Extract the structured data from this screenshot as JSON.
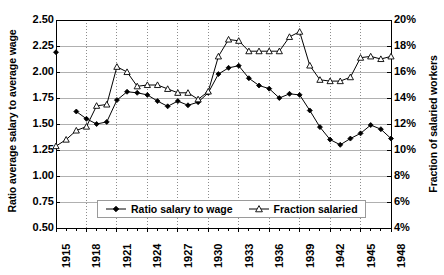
{
  "chart_data": {
    "type": "line",
    "title": "",
    "subtitle": "",
    "xlabel": "",
    "ylabel": "Ratio average salary to average wage",
    "ylabel_right": "Fraction of salaried workers",
    "grid": true,
    "legend_position": "bottom-center",
    "x": [
      1915,
      1916,
      1917,
      1918,
      1919,
      1920,
      1921,
      1922,
      1923,
      1924,
      1925,
      1926,
      1927,
      1928,
      1929,
      1930,
      1931,
      1932,
      1933,
      1934,
      1935,
      1936,
      1937,
      1938,
      1939,
      1940,
      1941,
      1942,
      1943,
      1944,
      1945,
      1946,
      1947,
      1948
    ],
    "xlim": [
      1915,
      1948
    ],
    "xtick_labels": [
      "1915",
      "1918",
      "1921",
      "1924",
      "1927",
      "1930",
      "1933",
      "1936",
      "1939",
      "1942",
      "1945",
      "1948"
    ],
    "xtick_values": [
      1915,
      1918,
      1921,
      1924,
      1927,
      1930,
      1933,
      1936,
      1939,
      1942,
      1945,
      1948
    ],
    "ylim": [
      0.5,
      2.5
    ],
    "ytick_labels": [
      "2.50",
      "2.25",
      "2.00",
      "1.75",
      "1.50",
      "1.25",
      "1.00",
      "0.75",
      "0.50"
    ],
    "ytick_values": [
      2.5,
      2.25,
      2.0,
      1.75,
      1.5,
      1.25,
      1.0,
      0.75,
      0.5
    ],
    "ylim_right": [
      4,
      20
    ],
    "ytick_labels_right": [
      "20%",
      "18%",
      "16%",
      "14%",
      "12%",
      "10%",
      "8%",
      "6%",
      "4%"
    ],
    "ytick_values_right": [
      20,
      18,
      16,
      14,
      12,
      10,
      8,
      6,
      4
    ],
    "series": [
      {
        "name": "Ratio salary to wage",
        "axis": "left",
        "marker": "filled-diamond",
        "color": "#000000",
        "values": [
          2.19,
          null,
          1.62,
          1.55,
          1.5,
          1.52,
          1.73,
          1.81,
          1.8,
          1.78,
          1.72,
          1.67,
          1.72,
          1.68,
          1.71,
          1.8,
          1.98,
          2.04,
          2.06,
          1.94,
          1.87,
          1.84,
          1.75,
          1.79,
          1.78,
          1.63,
          1.47,
          1.35,
          1.3,
          1.36,
          1.41,
          1.49,
          1.45,
          1.36
        ]
      },
      {
        "name": "Fraction salaried",
        "axis": "right",
        "marker": "open-triangle",
        "color": "#000000",
        "values": [
          10.3,
          10.8,
          11.5,
          11.8,
          13.4,
          13.5,
          16.4,
          16.0,
          14.9,
          15.0,
          15.0,
          14.7,
          14.4,
          14.4,
          13.9,
          14.5,
          17.2,
          18.5,
          18.4,
          17.6,
          17.6,
          17.6,
          17.6,
          18.7,
          19.1,
          16.5,
          15.4,
          15.3,
          15.3,
          15.6,
          17.1,
          17.2,
          17.0,
          17.2
        ]
      }
    ],
    "legend": [
      {
        "label": "Ratio salary to wage",
        "marker": "filled-diamond"
      },
      {
        "label": "Fraction salaried",
        "marker": "open-triangle"
      }
    ]
  }
}
